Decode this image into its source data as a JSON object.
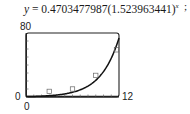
{
  "equation": {
    "lhs": "y",
    "equals": " = ",
    "coefficient": "0.4703477987",
    "base": "(1.523963441)",
    "exponent": "x",
    "trailing": ";"
  },
  "axis_labels": {
    "ymax": "80",
    "ymin": "0",
    "xmin": "0",
    "xmax": "12"
  },
  "chart_data": {
    "type": "scatter",
    "xlabel": "",
    "ylabel": "",
    "xlim": [
      0,
      12
    ],
    "ylim": [
      0,
      80
    ],
    "grid": false,
    "x_ticks": 12,
    "y_ticks": 8,
    "series": [
      {
        "name": "data points",
        "marker": "square",
        "x": [
          3,
          6,
          9,
          12
        ],
        "y": [
          7,
          10,
          27,
          59
        ]
      },
      {
        "name": "exponential fit",
        "type": "line",
        "equation": "y = 0.4703477987(1.523963441)^x",
        "x": [
          0,
          1,
          2,
          3,
          4,
          5,
          6,
          7,
          8,
          9,
          10,
          11,
          12
        ],
        "y": [
          0.47,
          0.72,
          1.09,
          1.67,
          2.54,
          3.87,
          5.89,
          8.98,
          13.68,
          20.85,
          31.78,
          48.43,
          73.8
        ]
      }
    ]
  }
}
